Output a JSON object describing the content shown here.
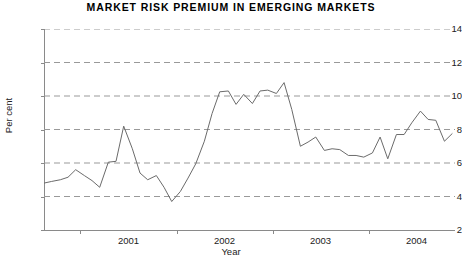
{
  "chart_data": {
    "type": "line",
    "title": "MARKET RISK PREMIUM IN EMERGING MARKETS",
    "xlabel": "Year",
    "ylabel": "Per cent",
    "ylim": [
      2,
      14
    ],
    "yticks": [
      2,
      4,
      6,
      8,
      10,
      12,
      14
    ],
    "ytick_labels": [
      "2",
      "4",
      "6",
      "8",
      "10",
      "12",
      "14"
    ],
    "xlim": [
      2000.62,
      2004.9
    ],
    "xticks": [
      2001.0,
      2002.0,
      2003.0,
      2004.0
    ],
    "xtick_labels": [
      "2001",
      "2002",
      "2003",
      "2004"
    ],
    "xtick_label_offset_years": 0.5,
    "grid": true,
    "grid_axis": "y",
    "grid_style": "dashed",
    "grid_color": "#999999",
    "legend": false,
    "line_color": "#6b6b6b",
    "line_width": 1,
    "background": "#ffffff",
    "series": [
      {
        "name": "Market risk premium",
        "x": [
          2000.62,
          2000.7,
          2000.79,
          2000.87,
          2000.95,
          2001.04,
          2001.12,
          2001.2,
          2001.29,
          2001.37,
          2001.45,
          2001.54,
          2001.62,
          2001.7,
          2001.79,
          2001.87,
          2001.95,
          2002.04,
          2002.12,
          2002.2,
          2002.29,
          2002.37,
          2002.45,
          2002.54,
          2002.62,
          2002.7,
          2002.79,
          2002.87,
          2002.95,
          2003.04,
          2003.12,
          2003.2,
          2003.29,
          2003.37,
          2003.45,
          2003.54,
          2003.62,
          2003.7,
          2003.79,
          2003.87,
          2003.95,
          2004.04,
          2004.12,
          2004.2,
          2004.29,
          2004.37,
          2004.45,
          2004.54,
          2004.62,
          2004.7,
          2004.79,
          2004.87
        ],
        "values": [
          4.8,
          4.9,
          5.0,
          5.15,
          5.6,
          5.25,
          4.95,
          4.55,
          6.05,
          6.1,
          8.2,
          6.85,
          5.4,
          5.0,
          5.25,
          4.55,
          3.7,
          4.3,
          5.1,
          5.95,
          7.3,
          8.95,
          10.25,
          10.3,
          9.5,
          10.1,
          9.55,
          10.3,
          10.35,
          10.15,
          10.8,
          9.2,
          7.0,
          7.25,
          7.55,
          6.75,
          6.85,
          6.8,
          6.45,
          6.45,
          6.35,
          6.6,
          7.55,
          6.25,
          7.7,
          7.7,
          8.4,
          9.1,
          8.6,
          8.55,
          7.3,
          7.75
        ]
      }
    ]
  }
}
